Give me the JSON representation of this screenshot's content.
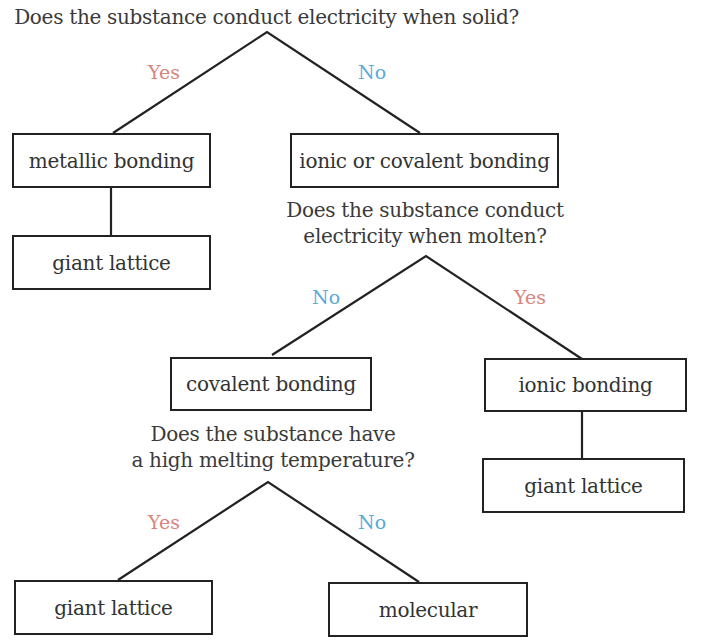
{
  "questions": {
    "q1": "Does the substance conduct electricity when solid?",
    "q2_line1": "Does the substance conduct",
    "q2_line2": "electricity when molten?",
    "q3_line1": "Does the substance have",
    "q3_line2": "a high melting temperature?"
  },
  "branch_labels": {
    "q1_yes": "Yes",
    "q1_no": "No",
    "q2_no": "No",
    "q2_yes": "Yes",
    "q3_yes": "Yes",
    "q3_no": "No"
  },
  "nodes": {
    "metallic": "metallic bonding",
    "metallic_giant": "giant lattice",
    "ionic_or_covalent": "ionic or covalent bonding",
    "covalent": "covalent bonding",
    "ionic": "ionic bonding",
    "ionic_giant": "giant lattice",
    "covalent_giant": "giant lattice",
    "molecular": "molecular"
  },
  "colors": {
    "yes": "#d9847a",
    "no": "#5aaad8",
    "line": "#222222"
  }
}
